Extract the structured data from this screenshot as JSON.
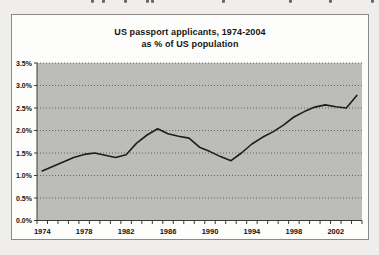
{
  "page": {
    "clipped_text_fragment_xs": [
      91,
      102,
      124,
      146,
      151,
      222,
      289,
      329,
      371
    ]
  },
  "chart_data": {
    "type": "line",
    "title_line1": "US passport applicants, 1974-2004",
    "title_line2": "as % of US population",
    "x": [
      1974,
      1975,
      1976,
      1977,
      1978,
      1979,
      1980,
      1981,
      1982,
      1983,
      1984,
      1985,
      1986,
      1987,
      1988,
      1989,
      1990,
      1991,
      1992,
      1993,
      1994,
      1995,
      1996,
      1997,
      1998,
      1999,
      2000,
      2001,
      2002,
      2003,
      2004
    ],
    "values": [
      1.1,
      1.2,
      1.3,
      1.4,
      1.47,
      1.5,
      1.45,
      1.4,
      1.46,
      1.72,
      1.9,
      2.04,
      1.93,
      1.87,
      1.83,
      1.63,
      1.53,
      1.42,
      1.33,
      1.5,
      1.7,
      1.85,
      1.97,
      2.12,
      2.3,
      2.42,
      2.52,
      2.57,
      2.53,
      2.5,
      2.78
    ],
    "x_tick_labels": [
      "1974",
      "1978",
      "1982",
      "1986",
      "1990",
      "1994",
      "1998",
      "2002"
    ],
    "x_label_every": 4,
    "y_tick_labels": [
      "0.0%",
      "0.5%",
      "1.0%",
      "1.5%",
      "2.0%",
      "2.5%",
      "3.0%",
      "3.5%"
    ],
    "ylim": [
      0,
      3.5
    ],
    "y_step": 0.5,
    "grid": "horizontal-dotted",
    "legend": "none",
    "colors": {
      "plot_bg": "#bcbcba",
      "line": "#1d1d1d",
      "grid": "#4c4c4a",
      "axis": "#3a3a38",
      "tick": "#3a3a38",
      "text": "#121212"
    }
  }
}
